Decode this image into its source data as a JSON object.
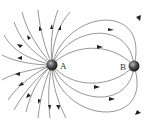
{
  "diagram": {
    "type": "electric field lines",
    "charges": [
      {
        "id": "A",
        "label": "A",
        "x": 52,
        "y": 65,
        "r": 5
      },
      {
        "id": "B",
        "label": "B",
        "x": 134,
        "y": 66,
        "r": 5
      }
    ],
    "colors": {
      "line": "#6a6a6a",
      "arrow": "#222222",
      "charge_dark": "#1a1a1a",
      "charge_light": "#9a9a9a"
    }
  }
}
